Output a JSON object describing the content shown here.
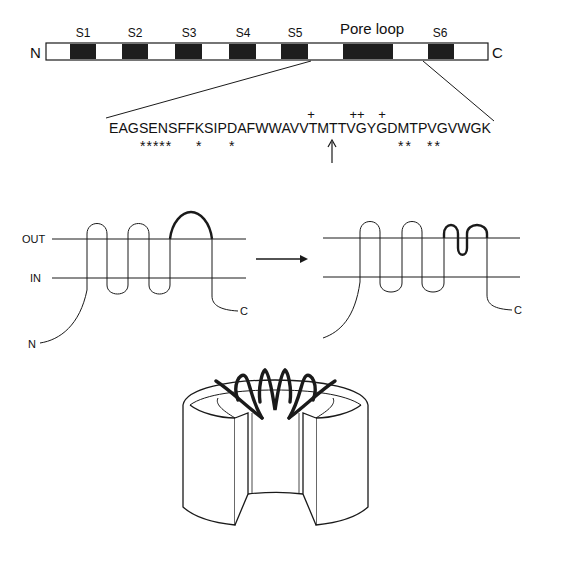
{
  "linear_map": {
    "n_label": "N",
    "c_label": "C",
    "segments": [
      {
        "label": "S1"
      },
      {
        "label": "S2"
      },
      {
        "label": "S3"
      },
      {
        "label": "S4"
      },
      {
        "label": "S5"
      },
      {
        "label": "Pore loop"
      },
      {
        "label": "S6"
      }
    ]
  },
  "sequence": {
    "text": "EAGSENSFFKSIPDAFWWAVVTMTTVGYGDMTPVGVWGK",
    "plus_marks": [
      "+",
      "++",
      "+"
    ],
    "star_marks": [
      "*****",
      "*",
      "*",
      "**",
      "**"
    ],
    "arrow": "↑"
  },
  "topology": {
    "out_label": "OUT",
    "in_label": "IN",
    "n_label": "N",
    "c_label_left": "C",
    "c_label_right": "C",
    "transition_arrow": "→"
  },
  "colors": {
    "line": "#1a1a1a",
    "segment_fill": "#1e1e1e",
    "background": "#ffffff"
  }
}
